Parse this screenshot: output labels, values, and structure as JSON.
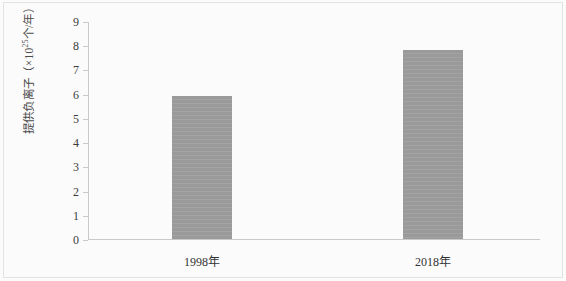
{
  "chart_data": {
    "type": "bar",
    "title": "",
    "subtitle": "",
    "xlabel": "",
    "ylabel": "提供负离子（×10²⁵个/年）",
    "ylabel_parts": {
      "prefix": "提供负离子（×10",
      "exponent": "25",
      "suffix": "个/年）"
    },
    "categories": [
      "1998年",
      "2018年"
    ],
    "values": [
      5.9,
      7.8
    ],
    "ylim": [
      0,
      9
    ],
    "ytick_labels": [
      "9",
      "8",
      "7",
      "6",
      "5",
      "4",
      "3",
      "2",
      "1",
      "0"
    ],
    "ytick_values": [
      9,
      8,
      7,
      6,
      5,
      4,
      3,
      2,
      1,
      0
    ],
    "grid": false,
    "legend": false,
    "legend_position": "none",
    "bar_color": "#9a9a9a",
    "axis_color": "#c9c9c9",
    "background_color": "#fbfbfb",
    "text_color": "#333333"
  }
}
